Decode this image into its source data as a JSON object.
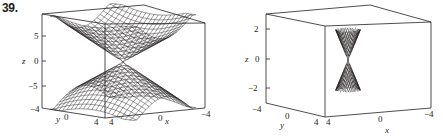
{
  "problem_number": "39.",
  "chart_data": [
    {
      "type": "surface3d",
      "title": "",
      "description": "Double-cone-like surface (elliptic/hyperbolic sheets) meeting at origin, wide mesh",
      "xlabel": "x",
      "ylabel": "y",
      "zlabel": "z",
      "x_ticks": [
        "4",
        "0",
        "-4"
      ],
      "y_ticks": [
        "-4",
        "0",
        "4"
      ],
      "z_ticks": [
        "5",
        "0",
        "-5"
      ],
      "xlim": [
        -4,
        4
      ],
      "ylim": [
        -4,
        4
      ],
      "zlim": [
        -8,
        8
      ],
      "grid": false
    },
    {
      "type": "surface3d",
      "title": "",
      "description": "Narrow double cone meeting at origin, fine vertical mesh",
      "xlabel": "x",
      "ylabel": "y",
      "zlabel": "z",
      "x_ticks": [
        "4",
        "0",
        "-4"
      ],
      "y_ticks": [
        "-4",
        "0",
        "4"
      ],
      "z_ticks": [
        "2",
        "0",
        "-2"
      ],
      "xlim": [
        -4,
        4
      ],
      "ylim": [
        -4,
        4
      ],
      "zlim": [
        -3,
        3
      ],
      "grid": false
    }
  ],
  "labels": {
    "plot1": {
      "z_axis": "z",
      "z5": "5",
      "z0": "0",
      "zm5": "−5",
      "y_axis": "y",
      "ym4": "−4",
      "y0": "0",
      "y4": "4",
      "x_axis": "x",
      "x4": "4",
      "x0": "0",
      "xm4": "−4"
    },
    "plot2": {
      "z_axis": "z",
      "z2": "2",
      "z0": "0",
      "zm2": "−2",
      "y_axis": "y",
      "ym4": "−4",
      "y0": "0",
      "y4": "4",
      "x_axis": "x",
      "x4": "4",
      "x0": "0",
      "xm4": "−4"
    }
  }
}
